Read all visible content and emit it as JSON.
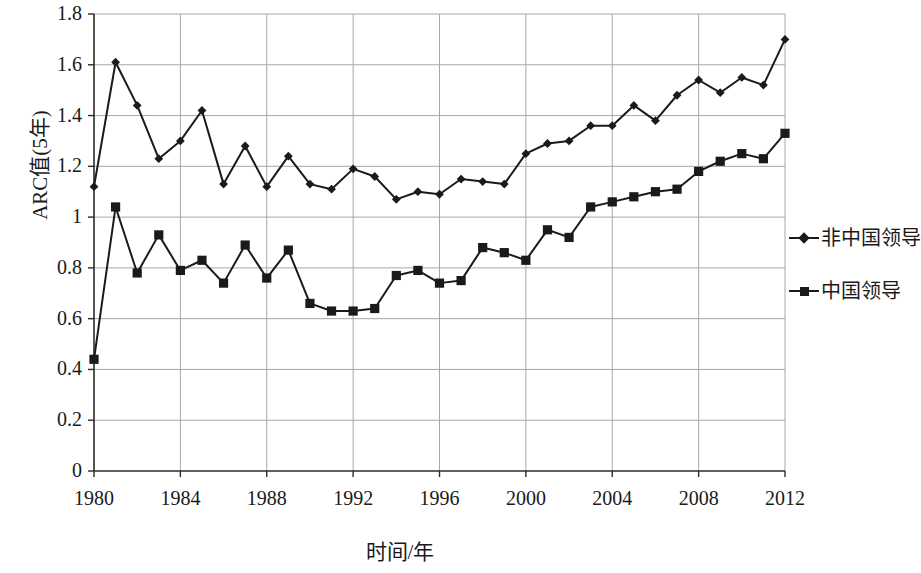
{
  "chart_data": {
    "type": "line",
    "title": "",
    "xlabel": "时间/年",
    "ylabel": "ARC值(5年)",
    "xlim": [
      1980,
      2012
    ],
    "ylim": [
      0,
      1.8
    ],
    "ytick_labels": [
      "1.8",
      "1.6",
      "1.4",
      "1.2",
      "1",
      "0.8",
      "0.6",
      "0.4",
      "0.2",
      "0"
    ],
    "ytick_values": [
      1.8,
      1.6,
      1.4,
      1.2,
      1.0,
      0.8,
      0.6,
      0.4,
      0.2,
      0
    ],
    "xtick_labels": [
      "1980",
      "1984",
      "1988",
      "1992",
      "1996",
      "2000",
      "2004",
      "2008",
      "2012"
    ],
    "xtick_values": [
      1980,
      1984,
      1988,
      1992,
      1996,
      2000,
      2004,
      2008,
      2012
    ],
    "grid": true,
    "legend_position": "right",
    "x": [
      1980,
      1981,
      1982,
      1983,
      1984,
      1985,
      1986,
      1987,
      1988,
      1989,
      1990,
      1991,
      1992,
      1993,
      1994,
      1995,
      1996,
      1997,
      1998,
      1999,
      2000,
      2001,
      2002,
      2003,
      2004,
      2005,
      2006,
      2007,
      2008,
      2009,
      2010,
      2011,
      2012
    ],
    "series": [
      {
        "name": "非中国领导",
        "marker": "diamond",
        "color": "#1a1a1a",
        "values": [
          1.12,
          1.61,
          1.44,
          1.23,
          1.3,
          1.42,
          1.13,
          1.28,
          1.12,
          1.24,
          1.13,
          1.11,
          1.19,
          1.16,
          1.07,
          1.1,
          1.09,
          1.15,
          1.14,
          1.13,
          1.25,
          1.29,
          1.3,
          1.36,
          1.36,
          1.44,
          1.38,
          1.48,
          1.54,
          1.49,
          1.55,
          1.52,
          1.7
        ]
      },
      {
        "name": "中国领导",
        "marker": "square",
        "color": "#1a1a1a",
        "values": [
          0.44,
          1.04,
          0.78,
          0.93,
          0.79,
          0.83,
          0.74,
          0.89,
          0.76,
          0.87,
          0.66,
          0.63,
          0.63,
          0.64,
          0.77,
          0.79,
          0.74,
          0.75,
          0.88,
          0.86,
          0.83,
          0.95,
          0.92,
          1.04,
          1.06,
          1.08,
          1.1,
          1.11,
          1.18,
          1.22,
          1.25,
          1.23,
          1.33
        ]
      }
    ]
  },
  "legend": [
    {
      "label": "非中国领导",
      "marker": "diamond"
    },
    {
      "label": "中国领导",
      "marker": "square"
    }
  ]
}
